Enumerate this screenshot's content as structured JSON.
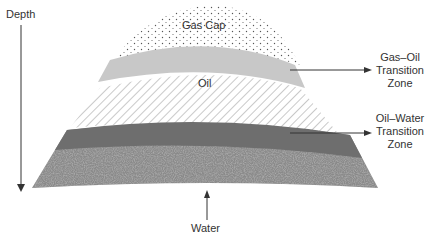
{
  "diagram": {
    "type": "reservoir-cross-section",
    "axis": {
      "label": "Depth",
      "direction": "down"
    },
    "zones": [
      {
        "id": "gas-cap",
        "label": "Gas Cap",
        "fill": "dotted"
      },
      {
        "id": "gas-oil-transition",
        "label": "Gas–Oil Transition Zone",
        "fill": "#c8c8c8"
      },
      {
        "id": "oil",
        "label": "Oil",
        "fill": "hatched"
      },
      {
        "id": "oil-water-transition",
        "label": "Oil–Water Transition Zone",
        "fill": "#6e6e6e"
      },
      {
        "id": "water",
        "label": "Water",
        "fill": "speckled"
      }
    ],
    "labels": {
      "depth": "Depth",
      "gas_cap": "Gas Cap",
      "oil": "Oil",
      "gas_oil_1": "Gas–Oil",
      "gas_oil_2": "Transition",
      "gas_oil_3": "Zone",
      "oil_water_1": "Oil–Water",
      "oil_water_2": "Transition",
      "oil_water_3": "Zone",
      "water": "Water"
    },
    "colors": {
      "text": "#333333",
      "line": "#333333",
      "gas_oil_band": "#c8c8c8",
      "oil_water_band": "#6e6e6e",
      "water_base": "#8a8a8a"
    }
  }
}
